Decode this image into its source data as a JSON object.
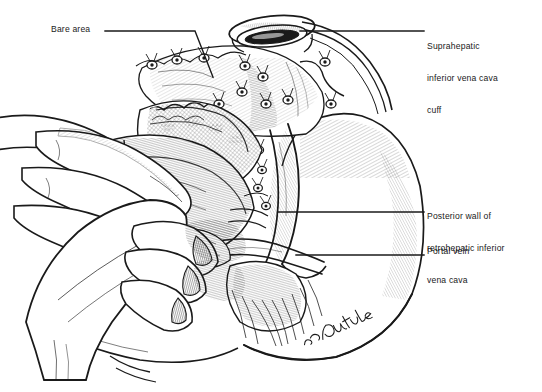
{
  "figure": {
    "type": "surgical-anatomical-line-illustration",
    "background_color": "#ffffff",
    "ink_color": "#1a1a1a",
    "width": 542,
    "height": 392,
    "signature": "Jon Coulter"
  },
  "labels": [
    {
      "id": "bare-area",
      "text": "Bare area",
      "lines": [
        "Bare area"
      ],
      "align": "right",
      "x": 51,
      "y": 24
    },
    {
      "id": "suprahepatic-ivc-cuff",
      "text": "Suprahepatic inferior vena cava cuff",
      "lines": [
        "Suprahepatic",
        "inferior vena cava",
        "cuff"
      ],
      "align": "left",
      "x": 427,
      "y": 20
    },
    {
      "id": "posterior-wall-retrohepatic-ivc",
      "text": "Posterior wall of retrohepatic inferior vena cava",
      "lines": [
        "Posterior wall of",
        "retrohepatic inferior",
        "vena cava"
      ],
      "align": "left",
      "x": 427,
      "y": 190
    },
    {
      "id": "portal-vein",
      "text": "Portal vein",
      "lines": [
        "Portal vein"
      ],
      "align": "left",
      "x": 427,
      "y": 246
    }
  ],
  "leader_lines": [
    {
      "id": "leader-bare-area",
      "for": "bare-area",
      "path": "M 105 31 L 195 31 L 212 76"
    },
    {
      "id": "leader-suprahepatic",
      "for": "suprahepatic-ivc-cuff",
      "path": "M 424 31 L 300 31"
    },
    {
      "id": "leader-posterior",
      "for": "posterior-wall-retrohepatic-ivc",
      "path": "M 424 212 L 278 212"
    },
    {
      "id": "leader-portal",
      "for": "portal-vein",
      "path": "M 424 255 L 296 255"
    }
  ],
  "anatomy_parts": [
    {
      "id": "liver-right-lobe",
      "name": "Right lobe of liver"
    },
    {
      "id": "liver-left-lobe",
      "name": "Left lobe of liver"
    },
    {
      "id": "bare-area-surface",
      "name": "Bare area of the liver (diaphragmatic surface)"
    },
    {
      "id": "suprahepatic-ivc-cuff",
      "name": "Suprahepatic inferior vena cava cuff"
    },
    {
      "id": "retrohepatic-ivc",
      "name": "Retrohepatic inferior vena cava — posterior wall"
    },
    {
      "id": "portal-vein",
      "name": "Portal vein"
    },
    {
      "id": "ligature-knots",
      "name": "Tied ligatures on divided short hepatic veins"
    },
    {
      "id": "surgeon-hand-upper",
      "name": "Surgeon's upper retracting hand"
    },
    {
      "id": "surgeon-hand-lower",
      "name": "Surgeon's lower retracting hand"
    }
  ]
}
